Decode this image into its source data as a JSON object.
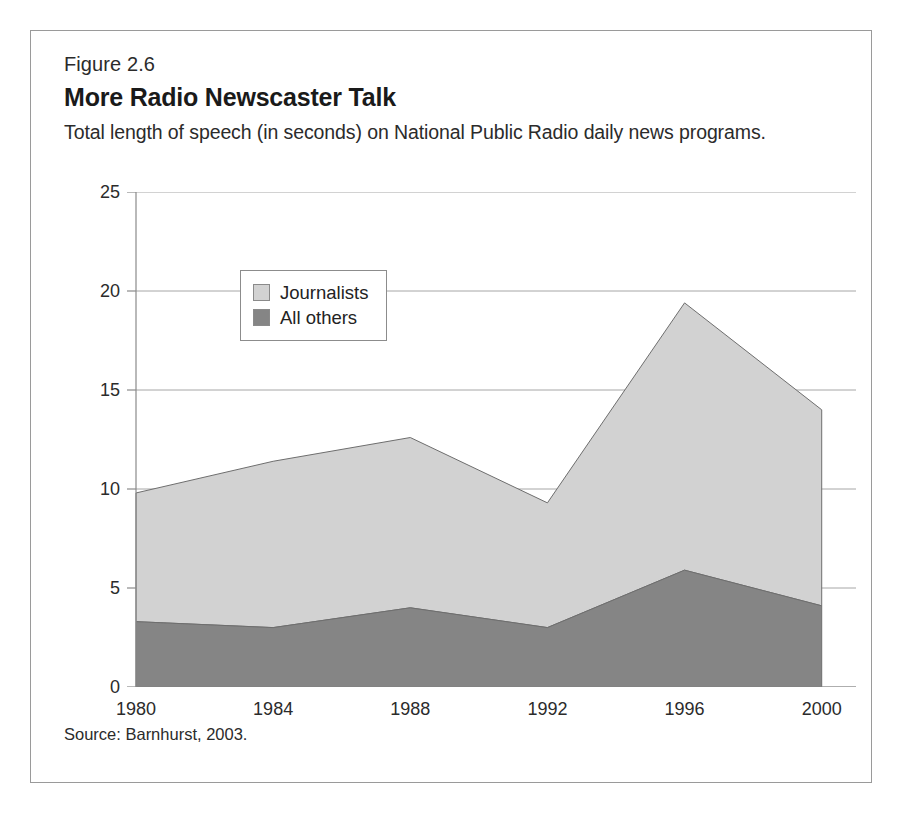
{
  "figure": {
    "number": "Figure 2.6",
    "title": "More Radio Newscaster Talk",
    "subtitle": "Total length of speech (in seconds) on National Public Radio daily news programs.",
    "source": "Source: Barnhurst, 2003."
  },
  "legend": {
    "position": "inside-top-left",
    "items": [
      {
        "label": "Journalists",
        "color": "#d2d2d2"
      },
      {
        "label": "All others",
        "color": "#858585"
      }
    ]
  },
  "axes": {
    "y_ticks": [
      "0",
      "5",
      "10",
      "15",
      "20",
      "25"
    ],
    "x_ticks": [
      "1980",
      "1984",
      "1988",
      "1992",
      "1996",
      "2000"
    ]
  },
  "chart_data": {
    "type": "area",
    "stacked": true,
    "title": "More Radio Newscaster Talk",
    "subtitle": "Total length of speech (in seconds) on National Public Radio daily news programs.",
    "xlabel": "",
    "ylabel": "",
    "ylim": [
      0,
      25
    ],
    "xlim": [
      1980,
      2001
    ],
    "grid": "horizontal",
    "categories": [
      1980,
      1984,
      1988,
      1992,
      1996,
      2000
    ],
    "x": [
      1980,
      1984,
      1988,
      1992,
      1996,
      2000
    ],
    "series": [
      {
        "name": "All others",
        "color": "#858585",
        "values": [
          3.3,
          3.0,
          4.0,
          3.0,
          5.9,
          4.1
        ]
      },
      {
        "name": "Journalists",
        "color": "#d2d2d2",
        "values": [
          6.5,
          8.4,
          8.6,
          6.3,
          13.5,
          9.9
        ]
      }
    ],
    "stack_totals": [
      9.8,
      11.4,
      12.6,
      9.3,
      19.4,
      14.0
    ],
    "y_ticks": [
      0,
      5,
      10,
      15,
      20,
      25
    ],
    "x_ticks": [
      1980,
      1984,
      1988,
      1992,
      1996,
      2000
    ],
    "legend": [
      "Journalists",
      "All others"
    ],
    "source": "Source: Barnhurst, 2003."
  }
}
